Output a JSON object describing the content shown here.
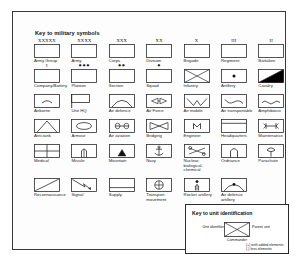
{
  "legend": {
    "title": "Key to military symbols",
    "rows": [
      [
        {
          "label": "Army Group",
          "echelon": "XXXXX",
          "icon": "plain-box",
          "echelon_style": "letters"
        },
        {
          "label": "Army",
          "echelon": "XXXX",
          "icon": "plain-box",
          "echelon_style": "letters"
        },
        {
          "label": "Corps",
          "echelon": "XXX",
          "icon": "plain-box",
          "echelon_style": "letters"
        },
        {
          "label": "Division",
          "echelon": "XX",
          "icon": "plain-box",
          "echelon_style": "letters"
        },
        {
          "label": "Brigade",
          "echelon": "X",
          "icon": "plain-box",
          "echelon_style": "letters"
        },
        {
          "label": "Regiment",
          "echelon": "III",
          "icon": "plain-box",
          "echelon_style": "letters"
        },
        {
          "label": "Battalion",
          "echelon": "II",
          "icon": "plain-box",
          "echelon_style": "letters"
        }
      ],
      [
        {
          "label": "Company/Battery",
          "echelon": "I",
          "icon": "plain-box",
          "echelon_style": "letters"
        },
        {
          "label": "Platoon",
          "echelon": "●●●",
          "icon": "plain-box",
          "echelon_style": "dots"
        },
        {
          "label": "Section",
          "echelon": "●●",
          "icon": "plain-box",
          "echelon_style": "dots"
        },
        {
          "label": "Squad",
          "echelon": "●",
          "icon": "plain-box",
          "echelon_style": "dots"
        },
        {
          "label": "Infantry",
          "echelon": "",
          "icon": "infantry-cross",
          "echelon_style": "none"
        },
        {
          "label": "Artillery",
          "echelon": "",
          "icon": "artillery-dot",
          "echelon_style": "none"
        },
        {
          "label": "Cavalry",
          "echelon": "",
          "icon": "cavalry-diagonal-fill",
          "echelon_style": "none"
        }
      ],
      [
        {
          "label": "Airborne",
          "echelon": "",
          "icon": "airborne-arc",
          "echelon_style": "none"
        },
        {
          "label": "Unit HQ",
          "echelon": "",
          "icon": "unit-hq-flag",
          "echelon_style": "none"
        },
        {
          "label": "Air defence",
          "echelon": "",
          "icon": "air-defence-dome",
          "echelon_style": "none"
        },
        {
          "label": "Air Force",
          "echelon": "",
          "icon": "air-force-wings",
          "echelon_style": "none"
        },
        {
          "label": "Air mobile",
          "echelon": "",
          "icon": "air-mobile-v",
          "echelon_style": "none"
        },
        {
          "label": "Air transportable",
          "echelon": "",
          "icon": "air-transportable-wave",
          "echelon_style": "none"
        },
        {
          "label": "Amphibious",
          "echelon": "",
          "icon": "amphibious-wave",
          "echelon_style": "none"
        }
      ],
      [
        {
          "label": "Anti-tank",
          "echelon": "",
          "icon": "anti-tank-triangle",
          "echelon_style": "none"
        },
        {
          "label": "Armour",
          "echelon": "",
          "icon": "armour-ellipse",
          "echelon_style": "none"
        },
        {
          "label": "Air aviation",
          "echelon": "",
          "icon": "air-aviation-propeller",
          "echelon_style": "none"
        },
        {
          "label": "Bridging",
          "echelon": "",
          "icon": "bridging-bowtie",
          "echelon_style": "none"
        },
        {
          "label": "Engineer",
          "echelon": "",
          "icon": "engineer-m",
          "echelon_style": "none"
        },
        {
          "label": "Headquarters",
          "echelon": "",
          "icon": "headquarters-bar",
          "echelon_style": "none"
        },
        {
          "label": "Maintenance",
          "echelon": "",
          "icon": "maintenance-wrench",
          "echelon_style": "none"
        }
      ],
      [
        {
          "label": "Medical",
          "echelon": "",
          "icon": "medical-cross",
          "echelon_style": "none"
        },
        {
          "label": "Missile",
          "echelon": "",
          "icon": "missile-launcher",
          "echelon_style": "none"
        },
        {
          "label": "Mountain",
          "echelon": "",
          "icon": "mountain-peak",
          "echelon_style": "none"
        },
        {
          "label": "Navy",
          "echelon": "",
          "icon": "navy-anchor",
          "echelon_style": "none"
        },
        {
          "label": "Nuclear, biological, chemical",
          "echelon": "",
          "icon": "nbc-symbol",
          "echelon_style": "none"
        },
        {
          "label": "Ordnance",
          "echelon": "",
          "icon": "ordnance-bomb",
          "echelon_style": "none"
        },
        {
          "label": "Parachute",
          "echelon": "",
          "icon": "parachute-canopy",
          "echelon_style": "none"
        }
      ],
      [
        {
          "label": "Reconnaissance",
          "echelon": "",
          "icon": "recon-diagonal-up",
          "echelon_style": "none"
        },
        {
          "label": "Signal",
          "echelon": "",
          "icon": "signal-lightning",
          "echelon_style": "none"
        },
        {
          "label": "Supply",
          "echelon": "",
          "icon": "supply-bar",
          "echelon_style": "none"
        },
        {
          "label": "Transport movement",
          "echelon": "",
          "icon": "transport-wheel",
          "echelon_style": "none"
        },
        {
          "label": "Rocket artillery",
          "echelon": "",
          "icon": "rocket-artillery",
          "echelon_style": "none"
        },
        {
          "label": "Air defence artillery",
          "echelon": "",
          "icon": "air-defence-artillery",
          "echelon_style": "none"
        },
        {
          "label": "",
          "echelon": "",
          "icon": "none",
          "echelon_style": "none"
        }
      ]
    ]
  },
  "inset": {
    "title": "Key to unit identification",
    "label_left": "Unit identifier",
    "label_right": "Parent unit",
    "label_bottom": "Commander",
    "note_line1": "(+) with added elements",
    "note_line2": "(-) less elements"
  },
  "colors": {
    "stroke": "#2b2b2b",
    "text": "#1a1a1a",
    "fill": "#ffffff",
    "cavalry_fill": "#000000"
  }
}
